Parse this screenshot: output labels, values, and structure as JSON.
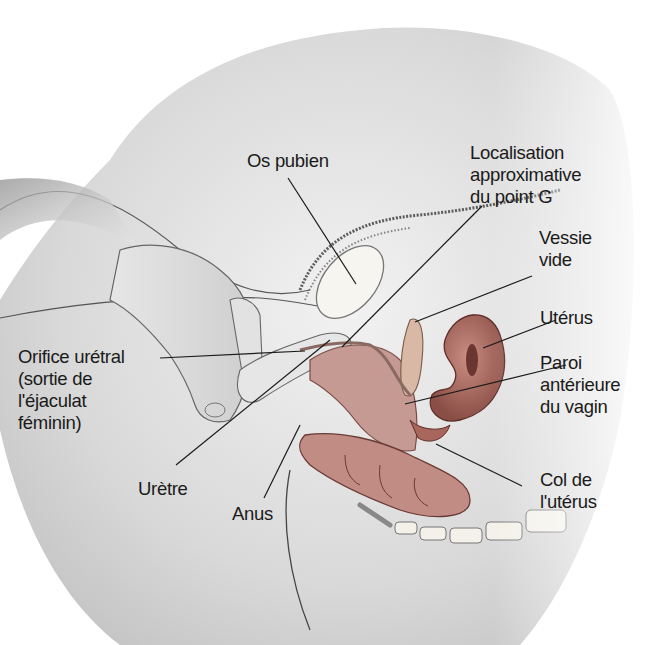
{
  "diagram": {
    "type": "anatomical-illustration",
    "labels": {
      "os_pubien": "Os pubien",
      "point_g": "Localisation\napproximative\ndu point G",
      "vessie": "Vessie\nvide",
      "uterus": "Utérus",
      "paroi": "Paroi\nantérieure\ndu vagin",
      "col": "Col de\nl'utérus",
      "orifice": "Orifice urétral\n(sortie de\nl'éjaculat\nféminin)",
      "uretre": "Urètre",
      "anus": "Anus"
    },
    "colors": {
      "skin_shadow": "#b8b8b8",
      "organ": "#b87a70",
      "organ_dark": "#8a4e46",
      "bone": "#f4f1ea",
      "leader_line": "#1a1a1a"
    }
  }
}
